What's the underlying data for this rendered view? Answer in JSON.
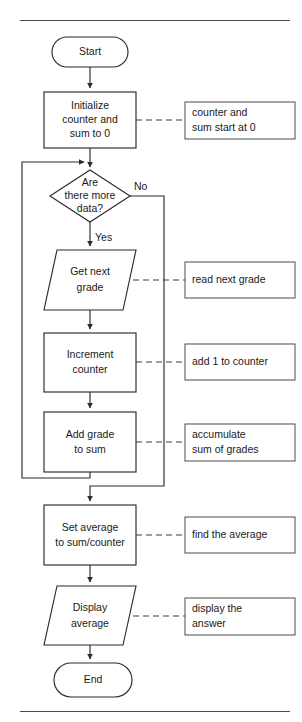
{
  "page": {
    "width": 302,
    "height": 722,
    "background_color": "#ffffff",
    "ink_color": "#2b2b2b"
  },
  "diagram": {
    "type": "flowchart",
    "title_rule_top": "",
    "title_rule_bottom": ""
  },
  "nodes": {
    "start": {
      "shape": "terminator",
      "label": "Start"
    },
    "initialize": {
      "shape": "process",
      "label_line1": "Initialize",
      "label_line2": "counter and",
      "label_line3": "sum to 0"
    },
    "decision": {
      "shape": "decision",
      "label_line1": "Are",
      "label_line2": "there more",
      "label_line3": "data?"
    },
    "get_grade": {
      "shape": "input-output",
      "label_line1": "Get next",
      "label_line2": "grade"
    },
    "increment": {
      "shape": "process",
      "label_line1": "Increment",
      "label_line2": "counter"
    },
    "add_grade": {
      "shape": "process",
      "label_line1": "Add grade",
      "label_line2": "to sum"
    },
    "set_average": {
      "shape": "process",
      "label_line1": "Set average",
      "label_line2": "to sum/counter"
    },
    "display": {
      "shape": "input-output",
      "label_line1": "Display",
      "label_line2": "average"
    },
    "end": {
      "shape": "terminator",
      "label": "End"
    }
  },
  "branch_labels": {
    "no": "No",
    "yes": "Yes"
  },
  "annotations": {
    "initialize_note": {
      "line1": "counter and",
      "line2": "sum start at 0"
    },
    "get_grade_note": {
      "line1": "read next grade",
      "line2": ""
    },
    "increment_note": {
      "line1": "add 1 to counter",
      "line2": ""
    },
    "add_grade_note": {
      "line1": "accumulate",
      "line2": "sum of grades"
    },
    "set_average_note": {
      "line1": "find the average",
      "line2": ""
    },
    "display_note": {
      "line1": "display the",
      "line2": "answer"
    }
  }
}
